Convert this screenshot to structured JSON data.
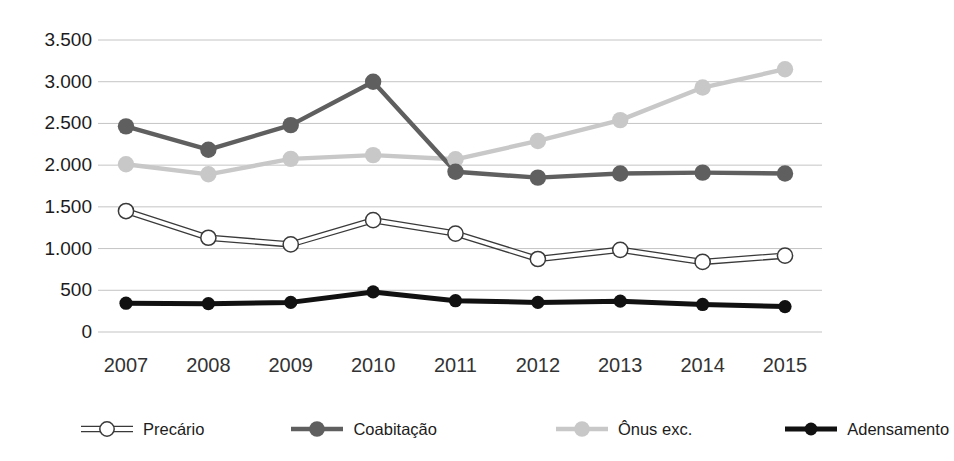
{
  "title": "",
  "chart_data": {
    "type": "line",
    "title": "",
    "subtitle": "",
    "xlabel": "",
    "ylabel": "",
    "categories": [
      "2007",
      "2008",
      "2009",
      "2010",
      "2011",
      "2012",
      "2013",
      "2014",
      "2015"
    ],
    "x": [
      2007,
      2008,
      2009,
      2010,
      2011,
      2012,
      2013,
      2014,
      2015
    ],
    "ylim": [
      0,
      3500
    ],
    "ytick_values": [
      3500,
      3000,
      2500,
      2000,
      1500,
      1000,
      500,
      0
    ],
    "ytick_labels": [
      "3.500",
      "3.000",
      "2.500",
      "2.000",
      "1.500",
      "1.000",
      "500",
      "0"
    ],
    "grid": true,
    "grid_axis": "y",
    "legend_position": "bottom",
    "series": [
      {
        "name": "Precário",
        "color": "#ffffff",
        "line_color": "#3a3a3a",
        "marker": "open-circle",
        "values": [
          1450,
          1130,
          1050,
          1340,
          1180,
          875,
          985,
          840,
          915
        ]
      },
      {
        "name": "Coabitação",
        "color": "#5f5f5f",
        "line_color": "#5f5f5f",
        "marker": "filled-circle",
        "values": [
          2465,
          2185,
          2480,
          3000,
          1920,
          1850,
          1900,
          1910,
          1900
        ]
      },
      {
        "name": "Ônus exc.",
        "color": "#c8c8c8",
        "line_color": "#c8c8c8",
        "marker": "filled-circle",
        "values": [
          2010,
          1890,
          2075,
          2120,
          2070,
          2290,
          2540,
          2930,
          3150
        ]
      },
      {
        "name": "Adensamento",
        "color": "#111111",
        "line_color": "#111111",
        "marker": "filled-circle",
        "values": [
          345,
          340,
          355,
          480,
          375,
          355,
          370,
          330,
          305
        ]
      }
    ]
  },
  "axes": {
    "y_labels": [
      "3.500",
      "3.000",
      "2.500",
      "2.000",
      "1.500",
      "1.000",
      "500",
      "0"
    ],
    "x_labels": [
      "2007",
      "2008",
      "2009",
      "2010",
      "2011",
      "2012",
      "2013",
      "2014",
      "2015"
    ]
  },
  "legend": {
    "items": [
      {
        "label": "Precário",
        "swatch": "open-circle-marker"
      },
      {
        "label": "Coabitação",
        "swatch": "dark-gray-circle-marker"
      },
      {
        "label": "Ônus exc.",
        "swatch": "light-gray-circle-marker"
      },
      {
        "label": "Adensamento",
        "swatch": "black-circle-marker"
      }
    ]
  }
}
